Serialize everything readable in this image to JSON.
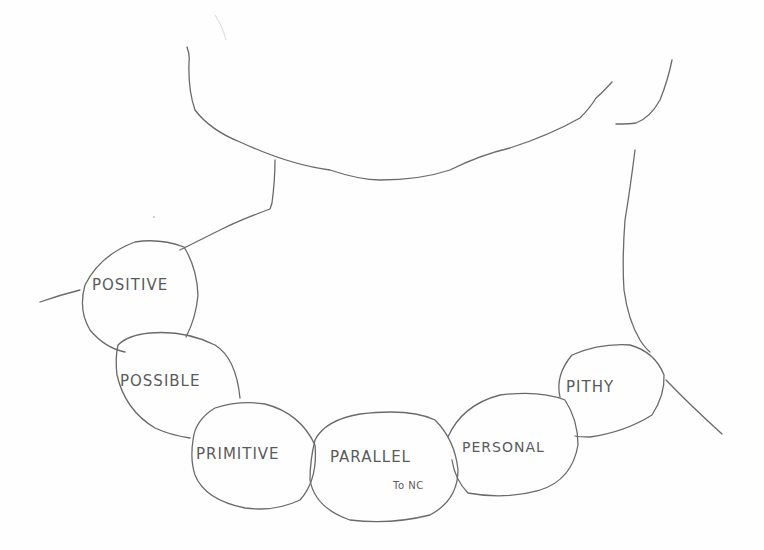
{
  "drawing": {
    "subject": "hand-drawn neck with beaded necklace",
    "stroke_color": "#6a6a6a",
    "text_color": "#5a5a5a",
    "background": "#fefefe"
  },
  "beads": [
    {
      "label": "POSITIVE",
      "sublabel": ""
    },
    {
      "label": "POSSIBLE",
      "sublabel": ""
    },
    {
      "label": "PRIMITIVE",
      "sublabel": ""
    },
    {
      "label": "PARALLEL",
      "sublabel": "To NC"
    },
    {
      "label": "PERSONAL",
      "sublabel": ""
    },
    {
      "label": "PITHY",
      "sublabel": ""
    }
  ]
}
